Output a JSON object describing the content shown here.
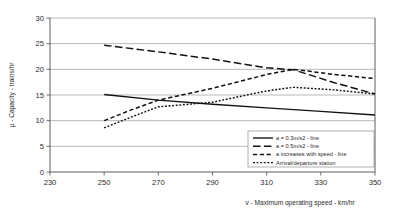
{
  "chart_data": {
    "type": "line",
    "title": "",
    "xlabel": "v - Maximum operating speed - km/hr",
    "ylabel": "µ - Capacity - trains/hr",
    "xlim": [
      230,
      350
    ],
    "ylim": [
      0,
      30
    ],
    "xticks": [
      230,
      250,
      270,
      290,
      310,
      330,
      350
    ],
    "yticks": [
      0,
      5,
      10,
      15,
      20,
      25,
      30
    ],
    "grid": "horizontal",
    "legend_position": "bottom-right",
    "series": [
      {
        "name": "a = 0.3m/s2 - line",
        "style": "solid",
        "x": [
          250,
          270,
          290,
          310,
          330,
          350
        ],
        "values": [
          15.1,
          14.0,
          13.2,
          12.5,
          11.8,
          11.1
        ]
      },
      {
        "name": "a = 0.5m/s2 - line",
        "style": "long-dash",
        "x": [
          250,
          270,
          290,
          310,
          320,
          335,
          350
        ],
        "values": [
          24.7,
          23.4,
          22.0,
          20.3,
          19.9,
          17.4,
          15.2
        ]
      },
      {
        "name": "a  increases with speed - line",
        "style": "dash",
        "x": [
          250,
          260,
          270,
          290,
          310,
          320,
          335,
          350
        ],
        "values": [
          10.0,
          12.1,
          14.0,
          16.3,
          19.0,
          20.0,
          19.0,
          18.2
        ]
      },
      {
        "name": "Arrival/departure  station",
        "style": "dot",
        "x": [
          250,
          260,
          270,
          290,
          310,
          320,
          335,
          350
        ],
        "values": [
          8.6,
          10.7,
          12.7,
          13.6,
          15.8,
          16.5,
          16.0,
          15.2
        ]
      }
    ]
  },
  "axes": {
    "y_title": "µ - Capacity - trains/hr",
    "x_title": "v - Maximum operating speed - km/hr",
    "y_tick_labels": [
      "0",
      "5",
      "10",
      "15",
      "20",
      "25",
      "30"
    ],
    "x_tick_labels": [
      "230",
      "250",
      "270",
      "290",
      "310",
      "330",
      "350"
    ]
  },
  "legend": {
    "items": [
      {
        "label": "a = 0.3m/s2 - line"
      },
      {
        "label": "a = 0.5m/s2 - line"
      },
      {
        "label": "a  increases with speed - line"
      },
      {
        "label": "Arrival/departure  station"
      }
    ]
  },
  "colors": {
    "series": "#111111",
    "grid": "#9a9a9a",
    "axis": "#4a4a4a",
    "text": "#2b2b2b",
    "background": "#ffffff"
  }
}
